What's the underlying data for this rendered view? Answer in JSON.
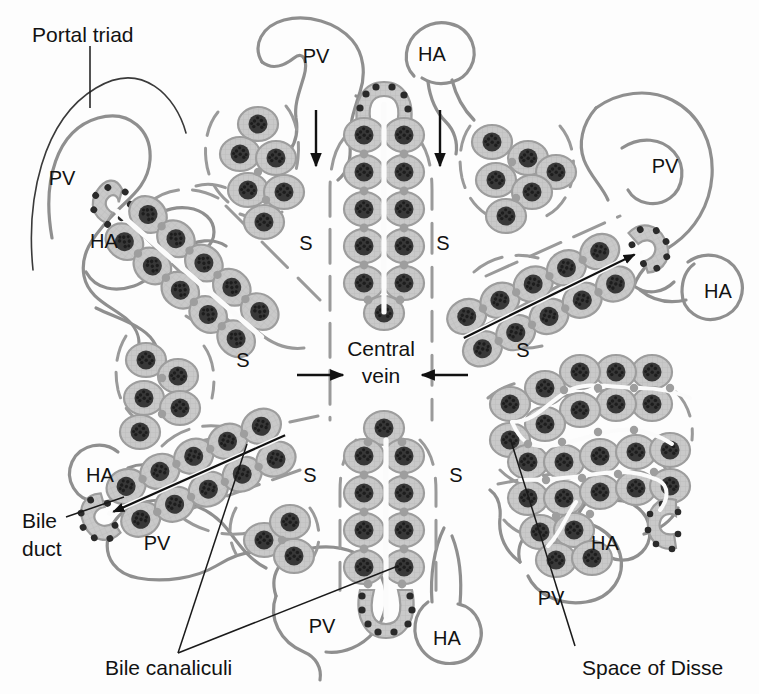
{
  "figure": {
    "background_color": "#fdfdfd",
    "cell_fill_color": "#c9c9c9",
    "cell_outline_color": "#9d9d9d",
    "nucleus_color": "#383838",
    "vessel_outline_color": "#8f8f8f",
    "canaliculus_color": "#fbfbfb",
    "label_color": "#121212"
  },
  "callouts": {
    "portal_triad": "Portal triad",
    "central_vein_line1": "Central",
    "central_vein_line2": "vein",
    "bile_duct_line1": "Bile",
    "bile_duct_line2": "duct",
    "bile_canaliculi": "Bile canaliculi",
    "space_of_disse": "Space of Disse"
  },
  "abbreviations": {
    "portal_vein": "PV",
    "hepatic_artery": "HA",
    "sinusoid": "S"
  },
  "vessel_labels": [
    {
      "id": "pv-top-left",
      "text": "PV",
      "x": 62,
      "y": 180
    },
    {
      "id": "pv-top-center",
      "text": "PV",
      "x": 316,
      "y": 58
    },
    {
      "id": "pv-top-right",
      "text": "PV",
      "x": 665,
      "y": 168
    },
    {
      "id": "pv-bottom-left",
      "text": "PV",
      "x": 157,
      "y": 545
    },
    {
      "id": "pv-bottom-center",
      "text": "PV",
      "x": 322,
      "y": 628
    },
    {
      "id": "pv-bottom-right",
      "text": "PV",
      "x": 551,
      "y": 600
    },
    {
      "id": "ha-left",
      "text": "HA",
      "x": 104,
      "y": 243
    },
    {
      "id": "ha-top-center",
      "text": "HA",
      "x": 432,
      "y": 56
    },
    {
      "id": "ha-right",
      "text": "HA",
      "x": 718,
      "y": 293
    },
    {
      "id": "ha-bottom-left",
      "text": "HA",
      "x": 100,
      "y": 477
    },
    {
      "id": "ha-bottom-center",
      "text": "HA",
      "x": 447,
      "y": 640
    },
    {
      "id": "ha-bottom-right",
      "text": "HA",
      "x": 605,
      "y": 545
    }
  ],
  "sinusoid_labels": [
    {
      "id": "s-top-left",
      "text": "S",
      "x": 306,
      "y": 245
    },
    {
      "id": "s-top-right",
      "text": "S",
      "x": 443,
      "y": 245
    },
    {
      "id": "s-mid-left",
      "text": "S",
      "x": 243,
      "y": 362
    },
    {
      "id": "s-mid-right",
      "text": "S",
      "x": 523,
      "y": 352
    },
    {
      "id": "s-bottom-left",
      "text": "S",
      "x": 310,
      "y": 477
    },
    {
      "id": "s-bottom-right",
      "text": "S",
      "x": 456,
      "y": 477
    }
  ],
  "flow_arrows": [
    {
      "id": "blood-flow-left",
      "direction": "down",
      "x": 316,
      "y_from": 110,
      "y_to": 168
    },
    {
      "id": "blood-flow-right",
      "direction": "down",
      "x": 440,
      "y_from": 110,
      "y_to": 168
    },
    {
      "id": "central-vein-left",
      "direction": "right",
      "y": 375,
      "x_from": 297,
      "x_to": 345
    },
    {
      "id": "central-vein-right",
      "direction": "left",
      "y": 375,
      "x_from": 468,
      "x_to": 420
    }
  ],
  "bile_flow_arrows": [
    {
      "id": "bile-flow-upper-right",
      "description": "bile flows along canaliculus toward portal triad bile duct"
    },
    {
      "id": "bile-flow-lower-left",
      "description": "bile flows along canaliculus toward portal triad bile duct"
    }
  ],
  "structures": [
    {
      "id": "plate-top-center",
      "name": "hepatic-plate",
      "orientation": "vertical",
      "has_bile_duct": true
    },
    {
      "id": "plate-bottom-center",
      "name": "hepatic-plate",
      "orientation": "vertical",
      "has_bile_duct": true
    },
    {
      "id": "plate-upper-left",
      "name": "hepatic-plate",
      "orientation": "diagonal",
      "has_bile_duct": true
    },
    {
      "id": "plate-upper-right",
      "name": "hepatic-plate",
      "orientation": "diagonal",
      "has_bile_duct": true
    },
    {
      "id": "plate-lower-left",
      "name": "hepatic-plate",
      "orientation": "diagonal",
      "has_bile_duct": true
    },
    {
      "id": "plate-lower-right",
      "name": "hepatic-plate",
      "orientation": "branched",
      "has_bile_duct": true
    },
    {
      "id": "cluster-top-left",
      "name": "hepatocyte-cluster"
    },
    {
      "id": "cluster-top-right",
      "name": "hepatocyte-cluster"
    },
    {
      "id": "cluster-mid-left",
      "name": "hepatocyte-cluster"
    },
    {
      "id": "cluster-bottom-mid",
      "name": "hepatocyte-cluster"
    }
  ]
}
